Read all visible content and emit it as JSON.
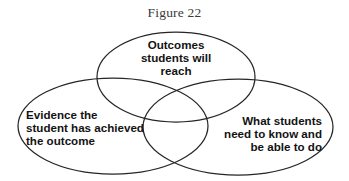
{
  "figure": {
    "title": "Figure 22",
    "type": "venn-diagram",
    "background_color": "#ffffff",
    "outline_color": "#262626",
    "text_color": "#131313",
    "title_color": "#3a3a3a"
  },
  "venn": {
    "sets": [
      {
        "id": "outcomes",
        "position": "top",
        "label": "Outcomes\nstudents will\nreach",
        "label_lines": [
          "Outcomes",
          "students will",
          "reach"
        ],
        "align": "center",
        "cx": 176,
        "cy": 77,
        "rx": 79,
        "ry": 45
      },
      {
        "id": "evidence",
        "position": "left",
        "label": "Evidence the\nstudent has achieved\nthe outcome",
        "label_lines": [
          "Evidence the",
          "student has achieved",
          "the outcome"
        ],
        "align": "left",
        "cx": 113,
        "cy": 126,
        "rx": 95,
        "ry": 48
      },
      {
        "id": "knowledge",
        "position": "right",
        "label": "What students\nneed to know and\nbe able to do",
        "label_lines": [
          "What students",
          "need to know and",
          "be able to do"
        ],
        "align": "right",
        "cx": 238,
        "cy": 127,
        "rx": 95,
        "ry": 48
      }
    ]
  }
}
